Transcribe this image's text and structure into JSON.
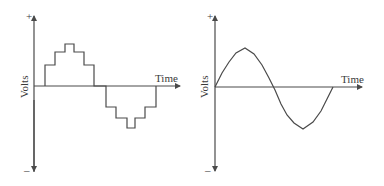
{
  "diagrams": [
    {
      "id": "stepped-wave",
      "y_axis_label": "Volts",
      "x_axis_label": "Time",
      "plus_label": "+",
      "minus_label": "–",
      "waveform": "stepped approximation of sine wave"
    },
    {
      "id": "sine-wave",
      "y_axis_label": "Volts",
      "x_axis_label": "Time",
      "plus_label": "+",
      "minus_label": "–",
      "waveform": "sine wave"
    }
  ],
  "colors": {
    "line": "#4a4a4a",
    "background": "#ffffff"
  }
}
